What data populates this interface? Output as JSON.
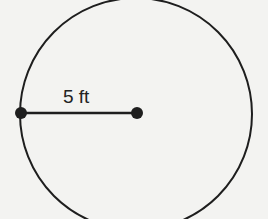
{
  "diagram": {
    "shape": "circle",
    "radius_label": "5 ft",
    "colors": {
      "stroke": "#1e1e1e",
      "background": "#f3f3f1"
    }
  }
}
